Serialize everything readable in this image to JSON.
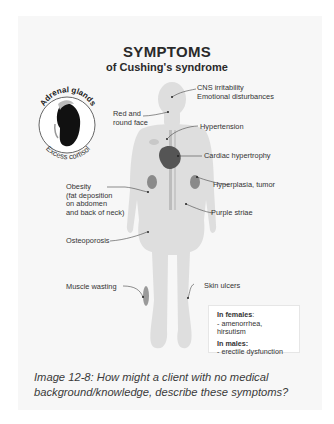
{
  "figure": {
    "title": "SYMPTOMS",
    "subtitle": "of Cushing's syndrome",
    "inset": {
      "top_label": "Adrenal glands",
      "bottom_label": "Excess cortisol"
    },
    "labels": {
      "cns": "CNS irritability\nEmotional disturbances",
      "face": "Red and\nround face",
      "hypertension": "Hypertension",
      "cardiac": "Cardiac hypertrophy",
      "obesity": "Obesity\n(fat deposition\non abdomen\nand back of neck)",
      "hyperplasia": "Hyperplasia, tumor",
      "striae": "Purple striae",
      "osteoporosis": "Osteoporosis",
      "muscle": "Muscle wasting",
      "skin": "Skin ulcers"
    },
    "legend": {
      "females_heading": "In females",
      "females_colon": ":",
      "females_item": "- amenorrhea, hirsutism",
      "males_heading": "In males:",
      "males_item": "- erectile dysfunction"
    }
  },
  "caption": "Image 12-8: How might a client with no medical background/knowledge, describe these symptoms?"
}
